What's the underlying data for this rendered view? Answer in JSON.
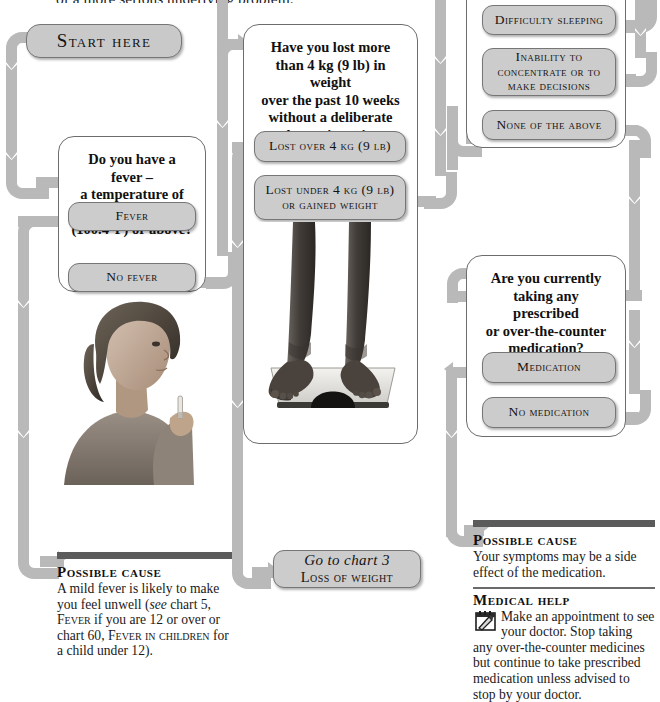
{
  "page": {
    "running_text": "of a more serious underlying problem."
  },
  "columns": {
    "left": {
      "start_button": "Start here",
      "question": {
        "line1": "Do you have a fever –",
        "line2": "a temperature of 38°C",
        "line3": "(100.4°F) or above?"
      },
      "options": [
        {
          "label": "Fever"
        },
        {
          "label": "No fever"
        }
      ],
      "photo_alt": "woman-taking-temperature",
      "advice": {
        "heading": "Possible cause",
        "text_1": "A mild fever is likely to make you feel unwell (",
        "see": "see",
        "text_2": " chart 5, ",
        "ref_1": "Fever",
        "text_3": " if you are 12 or over or chart 60, ",
        "ref_2": "Fever in children",
        "text_4": " for a child under 12)."
      }
    },
    "middle": {
      "question": {
        "line1": "Have you lost more",
        "line2": "than 4 kg (9 lb) in weight",
        "line3": "over the past 10 weeks",
        "line4": "without a deliberate",
        "line5": "change in eating habits?"
      },
      "options": [
        {
          "label": "Lost over 4 kg (9 lb)"
        },
        {
          "label": "Lost under 4 kg (9 lb) or gained weight"
        }
      ],
      "photo_alt": "feet-on-bathroom-scale",
      "goto": {
        "line1": "Go to chart 3",
        "line2": "Loss of weight"
      }
    },
    "right": {
      "symptom_options": [
        {
          "label": "Difficulty sleeping"
        },
        {
          "label": "Inability to concentrate or to make decisions"
        },
        {
          "label": "None of the above"
        }
      ],
      "question": {
        "line1": "Are you currently",
        "line2": "taking any prescribed",
        "line3": "or over-the-counter",
        "line4": "medication?"
      },
      "options": [
        {
          "label": "Medication"
        },
        {
          "label": "No medication"
        }
      ],
      "advice": {
        "cause_heading": "Possible cause",
        "cause_text": "Your symptoms may be a side effect of the medication.",
        "help_heading": "Medical help",
        "help_icon": "appointment-calendar-icon",
        "help_text": "Make an appointment to see your doctor. Stop taking any over-the-counter medicines but continue to take prescribed medication unless advised to stop by your doctor."
      }
    }
  },
  "colors": {
    "connector": "#b9b9b9",
    "button_fill": "#cccccc",
    "button_border": "#767676",
    "box_border": "#6d6d6d",
    "rule": "#5b5b5b",
    "text": "#161616"
  }
}
